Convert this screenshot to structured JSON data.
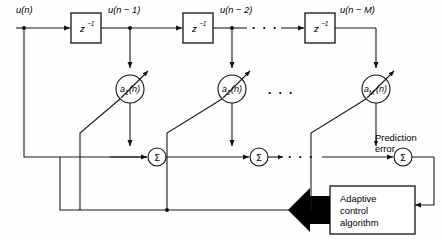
{
  "figure": {
    "background_color": "#fefefe",
    "line_color": "#1a1a1a",
    "width": 444,
    "height": 239
  },
  "signals": {
    "input_label": "u(n)",
    "tap1_label": "u(n − 1)",
    "tap2_label": "u(n − 2)",
    "tapM_label": "u(n − M)"
  },
  "delay_blocks": [
    {
      "id": "delay-1",
      "base": "z",
      "exponent": "−1"
    },
    {
      "id": "delay-2",
      "base": "z",
      "exponent": "−1"
    },
    {
      "id": "delay-M",
      "base": "z",
      "exponent": "−1"
    }
  ],
  "coefficients": [
    {
      "id": "coef-1",
      "base": "a",
      "subscript": "1",
      "arg": "(n)"
    },
    {
      "id": "coef-2",
      "base": "a",
      "subscript": "2",
      "arg": "(n)"
    },
    {
      "id": "coef-M",
      "base": "a",
      "subscript": "M",
      "arg": "(n)"
    }
  ],
  "adders": [
    {
      "id": "adder-1",
      "symbol": "Σ"
    },
    {
      "id": "adder-2",
      "symbol": "Σ"
    },
    {
      "id": "adder-M",
      "symbol": "Σ"
    }
  ],
  "ellipses": {
    "top_row": "· · ·",
    "coef_row": "· · ·",
    "adder_row": "· · ·"
  },
  "output": {
    "error_line1": "Prediction",
    "error_line2": "error"
  },
  "control_block": {
    "line1": "Adaptive",
    "line2": "control",
    "line3": "algorithm"
  }
}
